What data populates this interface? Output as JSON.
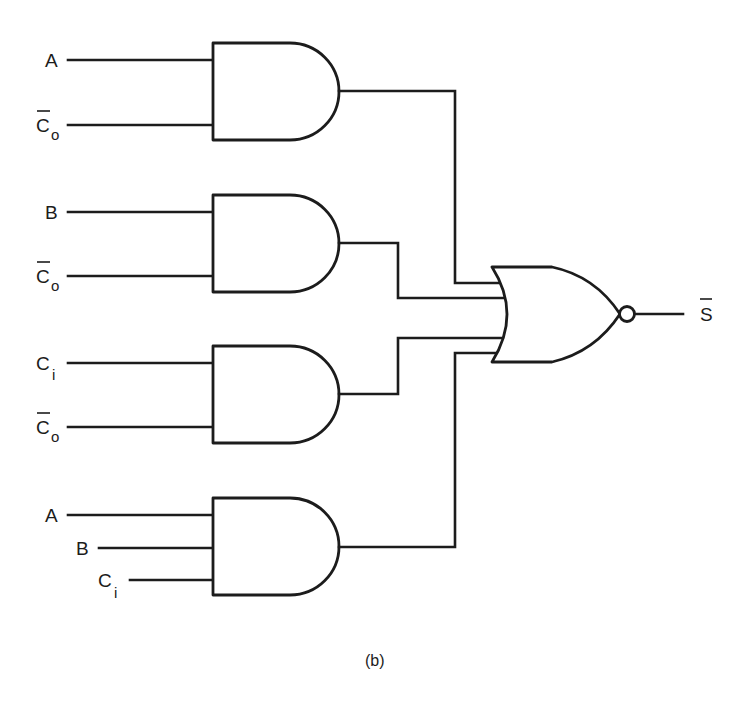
{
  "diagram": {
    "type": "logic-circuit",
    "caption": "(b)",
    "colors": {
      "line": "#1c1c1c",
      "background": "#ffffff"
    },
    "gates": [
      {
        "id": "and1",
        "type": "AND",
        "inputs": [
          {
            "label": "A",
            "subscript": "",
            "overbar": false
          },
          {
            "label": "C",
            "subscript": "o",
            "overbar": true
          }
        ]
      },
      {
        "id": "and2",
        "type": "AND",
        "inputs": [
          {
            "label": "B",
            "subscript": "",
            "overbar": false
          },
          {
            "label": "C",
            "subscript": "o",
            "overbar": true
          }
        ]
      },
      {
        "id": "and3",
        "type": "AND",
        "inputs": [
          {
            "label": "C",
            "subscript": "i",
            "overbar": false
          },
          {
            "label": "C",
            "subscript": "o",
            "overbar": true
          }
        ]
      },
      {
        "id": "and4",
        "type": "AND",
        "inputs": [
          {
            "label": "A",
            "subscript": "",
            "overbar": false
          },
          {
            "label": "B",
            "subscript": "",
            "overbar": false
          },
          {
            "label": "C",
            "subscript": "i",
            "overbar": false
          }
        ]
      },
      {
        "id": "nor1",
        "type": "NOR",
        "inputs_from": [
          "and1",
          "and2",
          "and3",
          "and4"
        ],
        "output": {
          "label": "S",
          "subscript": "",
          "overbar": true
        }
      }
    ]
  }
}
